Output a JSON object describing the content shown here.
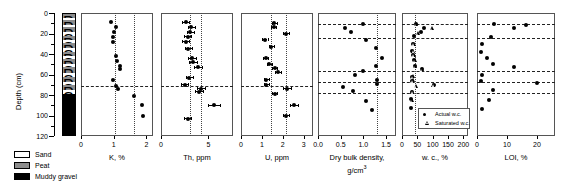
{
  "figure": {
    "y_axis": {
      "label": "Depth (cm)",
      "min": 0,
      "max": 120,
      "ticks": [
        0,
        20,
        40,
        60,
        80,
        100,
        120
      ],
      "minor_step": 10
    },
    "lithology": {
      "name": "lithology-column",
      "legend_title": "",
      "legend": [
        {
          "label": "Sand",
          "color": "#ffffff"
        },
        {
          "label": "Peat",
          "color": "#8c8c8c"
        },
        {
          "label": "Muddy gravel",
          "color": "#000000"
        }
      ],
      "bands": [
        {
          "top": 0,
          "bottom": 4,
          "unit": "Peat"
        },
        {
          "top": 4,
          "bottom": 6,
          "unit": "Sand"
        },
        {
          "top": 6,
          "bottom": 11,
          "unit": "Peat"
        },
        {
          "top": 11,
          "bottom": 13,
          "unit": "Sand"
        },
        {
          "top": 13,
          "bottom": 18,
          "unit": "Peat"
        },
        {
          "top": 18,
          "bottom": 21,
          "unit": "Sand"
        },
        {
          "top": 21,
          "bottom": 25,
          "unit": "Peat"
        },
        {
          "top": 25,
          "bottom": 28,
          "unit": "Sand"
        },
        {
          "top": 28,
          "bottom": 33,
          "unit": "Peat"
        },
        {
          "top": 33,
          "bottom": 37,
          "unit": "Sand"
        },
        {
          "top": 37,
          "bottom": 41,
          "unit": "Peat"
        },
        {
          "top": 41,
          "bottom": 44,
          "unit": "Sand"
        },
        {
          "top": 44,
          "bottom": 49,
          "unit": "Peat"
        },
        {
          "top": 49,
          "bottom": 52,
          "unit": "Sand"
        },
        {
          "top": 52,
          "bottom": 58,
          "unit": "Peat"
        },
        {
          "top": 58,
          "bottom": 61,
          "unit": "Sand"
        },
        {
          "top": 61,
          "bottom": 66,
          "unit": "Peat"
        },
        {
          "top": 66,
          "bottom": 69,
          "unit": "Sand"
        },
        {
          "top": 69,
          "bottom": 74,
          "unit": "Peat"
        },
        {
          "top": 74,
          "bottom": 78,
          "unit": "Sand"
        },
        {
          "top": 78,
          "bottom": 120,
          "unit": "Muddy gravel"
        }
      ]
    },
    "marker_legend": {
      "items": [
        {
          "label": "Actual w.c.",
          "marker": "filled-circle"
        },
        {
          "label": "Saturated w.c.",
          "marker": "open-triangle"
        }
      ]
    },
    "boundary_depth": 71
  },
  "chart_data": [
    {
      "type": "scatter",
      "id": "k-panel",
      "title": "",
      "xlabel": "K, %",
      "ylabel": "Depth (cm)",
      "xlim": [
        0,
        2.2
      ],
      "xticks": [
        0,
        1,
        2
      ],
      "xticklabels": [
        "0",
        "1",
        "2"
      ],
      "ylim": [
        0,
        120
      ],
      "grid": false,
      "reference_lines": {
        "vertical_dotted": [
          1.05,
          1.62
        ],
        "horizontal_dashed": [
          71
        ]
      },
      "series": [
        {
          "name": "K",
          "marker": "filled-circle",
          "points": [
            {
              "depth": 9,
              "value": 0.92
            },
            {
              "depth": 14,
              "value": 1.07
            },
            {
              "depth": 19,
              "value": 1.0
            },
            {
              "depth": 23,
              "value": 0.99
            },
            {
              "depth": 28,
              "value": 0.97
            },
            {
              "depth": 42,
              "value": 1.07
            },
            {
              "depth": 47,
              "value": 1.1
            },
            {
              "depth": 52,
              "value": 1.18
            },
            {
              "depth": 55,
              "value": 1.19
            },
            {
              "depth": 65,
              "value": 0.97
            },
            {
              "depth": 71,
              "value": 1.06
            },
            {
              "depth": 74,
              "value": 1.13
            },
            {
              "depth": 81,
              "value": 1.62
            },
            {
              "depth": 90,
              "value": 1.86
            },
            {
              "depth": 100,
              "value": 1.88
            }
          ]
        }
      ]
    },
    {
      "type": "scatter",
      "id": "th-panel",
      "title": "",
      "xlabel": "Th, ppm",
      "xlim": [
        0,
        7.6
      ],
      "xticks": [
        0,
        5
      ],
      "xticklabels": [
        "0",
        "5"
      ],
      "ylim": [
        0,
        120
      ],
      "grid": false,
      "reference_lines": {
        "vertical_dotted": [
          3.1,
          4.25
        ],
        "horizontal_dashed": [
          71
        ]
      },
      "series": [
        {
          "name": "Th",
          "marker": "filled-circle",
          "errorbars": true,
          "points": [
            {
              "depth": 9,
              "value": 2.6,
              "err": 0.35
            },
            {
              "depth": 14,
              "value": 3.2,
              "err": 0.4
            },
            {
              "depth": 19,
              "value": 3.1,
              "err": 0.4
            },
            {
              "depth": 23,
              "value": 2.8,
              "err": 0.35
            },
            {
              "depth": 28,
              "value": 2.6,
              "err": 0.35
            },
            {
              "depth": 35,
              "value": 2.9,
              "err": 0.35
            },
            {
              "depth": 44,
              "value": 3.3,
              "err": 0.4
            },
            {
              "depth": 48,
              "value": 3.4,
              "err": 0.4
            },
            {
              "depth": 53,
              "value": 3.9,
              "err": 0.45
            },
            {
              "depth": 63,
              "value": 3.0,
              "err": 0.35
            },
            {
              "depth": 70,
              "value": 2.5,
              "err": 0.35
            },
            {
              "depth": 74,
              "value": 4.2,
              "err": 0.45
            },
            {
              "depth": 77,
              "value": 4.0,
              "err": 0.4
            },
            {
              "depth": 90,
              "value": 5.6,
              "err": 0.6
            },
            {
              "depth": 103,
              "value": 2.8,
              "err": 0.4
            }
          ]
        }
      ]
    },
    {
      "type": "scatter",
      "id": "u-panel",
      "title": "",
      "xlabel": "U, ppm",
      "xlim": [
        0,
        3.45
      ],
      "xticks": [
        0,
        1,
        2,
        3
      ],
      "xticklabels": [
        "0",
        "1",
        "2",
        "3"
      ],
      "ylim": [
        0,
        120
      ],
      "grid": false,
      "reference_lines": {
        "vertical_dotted": [
          1.45,
          2.15
        ],
        "horizontal_dashed": [
          71
        ]
      },
      "series": [
        {
          "name": "U",
          "marker": "filled-circle",
          "errorbars": true,
          "points": [
            {
              "depth": 10,
              "value": 1.6,
              "err": 0.12
            },
            {
              "depth": 14,
              "value": 1.58,
              "err": 0.12
            },
            {
              "depth": 20,
              "value": 2.15,
              "err": 0.15
            },
            {
              "depth": 26,
              "value": 1.15,
              "err": 0.12
            },
            {
              "depth": 33,
              "value": 1.45,
              "err": 0.12
            },
            {
              "depth": 44,
              "value": 1.18,
              "err": 0.12
            },
            {
              "depth": 50,
              "value": 1.35,
              "err": 0.12
            },
            {
              "depth": 54,
              "value": 1.62,
              "err": 0.12
            },
            {
              "depth": 58,
              "value": 1.78,
              "err": 0.15
            },
            {
              "depth": 65,
              "value": 1.2,
              "err": 0.12
            },
            {
              "depth": 70,
              "value": 1.22,
              "err": 0.12
            },
            {
              "depth": 74,
              "value": 2.2,
              "err": 0.18
            },
            {
              "depth": 79,
              "value": 1.62,
              "err": 0.12
            },
            {
              "depth": 90,
              "value": 2.55,
              "err": 0.18
            },
            {
              "depth": 100,
              "value": 2.15,
              "err": 0.15
            }
          ]
        }
      ]
    },
    {
      "type": "scatter",
      "id": "dry-bulk-density-panel",
      "title": "",
      "xlabel": "Dry bulk density,",
      "xlabel2": "g/cm3",
      "xlim": [
        0,
        1.72
      ],
      "xticks": [
        0.0,
        0.5,
        1.0,
        1.5
      ],
      "xticklabels": [
        "0.0",
        "0.5",
        "1.0",
        "1.5"
      ],
      "ylim": [
        0,
        120
      ],
      "grid": false,
      "reference_lines": {
        "vertical_dotted": [
          1.3
        ],
        "horizontal_dashed": [
          11,
          24,
          57,
          67,
          78
        ]
      },
      "series": [
        {
          "name": "Dry bulk density",
          "marker": "filled-circle",
          "points": [
            {
              "depth": 11,
              "value": 1.0
            },
            {
              "depth": 15,
              "value": 0.6
            },
            {
              "depth": 19,
              "value": 0.72
            },
            {
              "depth": 26,
              "value": 1.05
            },
            {
              "depth": 34,
              "value": 1.28
            },
            {
              "depth": 44,
              "value": 1.42
            },
            {
              "depth": 52,
              "value": 1.28
            },
            {
              "depth": 57,
              "value": 1.0
            },
            {
              "depth": 60,
              "value": 0.82
            },
            {
              "depth": 65,
              "value": 1.3
            },
            {
              "depth": 69,
              "value": 1.3
            },
            {
              "depth": 72,
              "value": 0.55
            },
            {
              "depth": 76,
              "value": 0.78
            },
            {
              "depth": 86,
              "value": 1.05
            },
            {
              "depth": 95,
              "value": 1.2
            }
          ]
        }
      ]
    },
    {
      "type": "scatter",
      "id": "water-content-panel",
      "title": "",
      "xlabel": "w. c., %",
      "xlim": [
        0,
        215
      ],
      "xticks": [
        0,
        50,
        100,
        150,
        200
      ],
      "xticklabels": [
        "0",
        "50",
        "100",
        "150",
        "200"
      ],
      "ylim": [
        0,
        120
      ],
      "grid": false,
      "reference_lines": {
        "vertical_dotted": [
          42
        ],
        "horizontal_dashed": [
          11,
          24,
          57,
          67,
          78
        ]
      },
      "series": [
        {
          "name": "Actual w.c.",
          "marker": "filled-circle",
          "points": [
            {
              "depth": 11,
              "value": 44
            },
            {
              "depth": 15,
              "value": 73
            },
            {
              "depth": 19,
              "value": 62
            },
            {
              "depth": 22,
              "value": 40
            },
            {
              "depth": 30,
              "value": 36
            },
            {
              "depth": 37,
              "value": 34
            },
            {
              "depth": 41,
              "value": 36
            },
            {
              "depth": 46,
              "value": 38
            },
            {
              "depth": 52,
              "value": 41
            },
            {
              "depth": 55,
              "value": 64
            },
            {
              "depth": 62,
              "value": 34
            },
            {
              "depth": 66,
              "value": 33
            },
            {
              "depth": 70,
              "value": 105
            },
            {
              "depth": 77,
              "value": 32
            },
            {
              "depth": 84,
              "value": 30
            },
            {
              "depth": 93,
              "value": 28
            }
          ]
        },
        {
          "name": "Saturated w.c.",
          "marker": "open-triangle",
          "points": [
            {
              "depth": 12,
              "value": 47
            },
            {
              "depth": 16,
              "value": 100
            },
            {
              "depth": 21,
              "value": 54
            },
            {
              "depth": 31,
              "value": 40
            },
            {
              "depth": 38,
              "value": 39
            },
            {
              "depth": 42,
              "value": 40
            },
            {
              "depth": 47,
              "value": 43
            },
            {
              "depth": 53,
              "value": 44
            },
            {
              "depth": 56,
              "value": 67
            },
            {
              "depth": 63,
              "value": 38
            },
            {
              "depth": 67,
              "value": 37
            },
            {
              "depth": 71,
              "value": 104
            },
            {
              "depth": 72,
              "value": 47
            },
            {
              "depth": 78,
              "value": 36
            },
            {
              "depth": 86,
              "value": 34
            }
          ]
        }
      ]
    },
    {
      "type": "scatter",
      "id": "loi-panel",
      "title": "",
      "xlabel": "LOI, %",
      "xlim": [
        0,
        26
      ],
      "xticks": [
        0,
        10,
        20
      ],
      "xticklabels": [
        "0",
        "10",
        "20"
      ],
      "ylim": [
        0,
        120
      ],
      "grid": false,
      "reference_lines": {
        "vertical_dotted": [],
        "horizontal_dashed": [
          11,
          24,
          57,
          67,
          78
        ]
      },
      "series": [
        {
          "name": "LOI",
          "marker": "filled-circle",
          "points": [
            {
              "depth": 11,
              "value": 5.6
            },
            {
              "depth": 15,
              "value": 12.3
            },
            {
              "depth": 12,
              "value": 16.2
            },
            {
              "depth": 23,
              "value": 4.8
            },
            {
              "depth": 30,
              "value": 1.6
            },
            {
              "depth": 38,
              "value": 1.2
            },
            {
              "depth": 44,
              "value": 3.3
            },
            {
              "depth": 50,
              "value": 5.3
            },
            {
              "depth": 53,
              "value": 12.4
            },
            {
              "depth": 60,
              "value": 1.6
            },
            {
              "depth": 66,
              "value": 1.2
            },
            {
              "depth": 68,
              "value": 20.1
            },
            {
              "depth": 75,
              "value": 5.2
            },
            {
              "depth": 85,
              "value": 3.9
            },
            {
              "depth": 94,
              "value": 1.8
            }
          ]
        }
      ]
    }
  ]
}
